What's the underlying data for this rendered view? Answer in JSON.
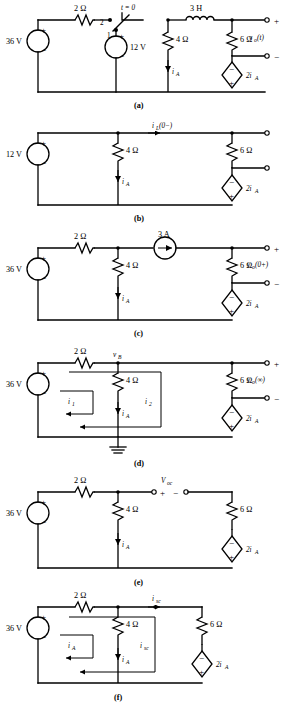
{
  "page": {
    "width": 288,
    "height": 713,
    "ink_color": "#000000",
    "background_color": "#ffffff"
  },
  "figures": [
    {
      "id": "a",
      "caption": "(a)",
      "source_label": "36 V",
      "source2_label": "12 V",
      "r1_label": "2 Ω",
      "r2_label": "4 Ω",
      "r3_label": "6 Ω",
      "inductor_label": "3 H",
      "switch_label": "t = 0",
      "switch_pos2": "2",
      "switch_pos1": "1",
      "current_label": "i",
      "current_sub": "A",
      "dependent_label": "2i",
      "dependent_sub": "A",
      "output_label": "v",
      "output_sub": "o",
      "output_arg": "(t)",
      "plus": "+",
      "minus": "−"
    },
    {
      "id": "b",
      "caption": "(b)",
      "source_label": "12 V",
      "r2_label": "4 Ω",
      "r3_label": "6 Ω",
      "inductor_current_label": "i",
      "inductor_current_sub": "L",
      "inductor_current_arg": "(0−)",
      "current_label": "i",
      "current_sub": "A",
      "dependent_label": "2i",
      "dependent_sub": "A",
      "plus": "+",
      "minus": "−"
    },
    {
      "id": "c",
      "caption": "(c)",
      "source_label": "36 V",
      "r1_label": "2 Ω",
      "r2_label": "4 Ω",
      "r3_label": "6 Ω",
      "current_source_label": "3 A",
      "current_label": "i",
      "current_sub": "A",
      "dependent_label": "2i",
      "dependent_sub": "A",
      "output_label": "v",
      "output_sub": "o",
      "output_arg": "(0+)",
      "plus": "+",
      "minus": "−"
    },
    {
      "id": "d",
      "caption": "(d)",
      "source_label": "36 V",
      "r1_label": "2 Ω",
      "r2_label": "4 Ω",
      "r3_label": "6 Ω",
      "node_label": "v",
      "node_sub": "B",
      "mesh1_label": "i",
      "mesh1_sub": "1",
      "mesh2_label": "i",
      "mesh2_sub": "2",
      "current_label": "i",
      "current_sub": "A",
      "dependent_label": "2i",
      "dependent_sub": "A",
      "output_label": "v",
      "output_sub": "o",
      "output_arg": "(∞)",
      "ground": "ground-symbol",
      "plus": "+",
      "minus": "−"
    },
    {
      "id": "e",
      "caption": "(e)",
      "source_label": "36 V",
      "r1_label": "2 Ω",
      "r2_label": "4 Ω",
      "r3_label": "6 Ω",
      "voc_label": "V",
      "voc_sub": "oc",
      "current_label": "i",
      "current_sub": "A",
      "dependent_label": "2i",
      "dependent_sub": "A",
      "plus": "+",
      "minus": "−"
    },
    {
      "id": "f",
      "caption": "(f)",
      "source_label": "36 V",
      "r1_label": "2 Ω",
      "r2_label": "4 Ω",
      "r3_label": "6 Ω",
      "isc_top_label": "i",
      "isc_top_sub": "sc",
      "mesh1_label": "i",
      "mesh1_sub": "A",
      "mesh2_label": "i",
      "mesh2_sub": "sc",
      "current_label": "i",
      "current_sub": "A",
      "dependent_label": "2i",
      "dependent_sub": "A",
      "plus": "+",
      "minus": "−"
    }
  ]
}
